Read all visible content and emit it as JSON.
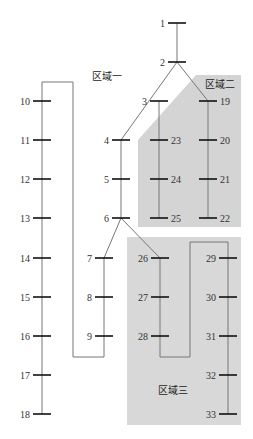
{
  "diagram": {
    "type": "IEEE 33-bus distribution network partition",
    "colors": {
      "background": "#ffffff",
      "zone_fill": "#d4d4d4",
      "line": "#777777",
      "bus": "#111111",
      "label": "#333333"
    },
    "zones": [
      {
        "id": "zone1",
        "label": "区域一",
        "x": 92,
        "y": 80
      },
      {
        "id": "zone2",
        "label": "区域二",
        "x": 205,
        "y": 88
      },
      {
        "id": "zone3",
        "label": "区域三",
        "x": 158,
        "y": 394
      }
    ],
    "buses": [
      {
        "id": 1,
        "x": 177,
        "y": 23,
        "label_side": "left"
      },
      {
        "id": 2,
        "x": 177,
        "y": 62,
        "label_side": "left"
      },
      {
        "id": 3,
        "x": 159,
        "y": 101,
        "label_side": "left"
      },
      {
        "id": 4,
        "x": 121,
        "y": 140,
        "label_side": "left"
      },
      {
        "id": 5,
        "x": 121,
        "y": 179,
        "label_side": "left"
      },
      {
        "id": 6,
        "x": 121,
        "y": 218,
        "label_side": "left"
      },
      {
        "id": 7,
        "x": 104,
        "y": 258,
        "label_side": "left"
      },
      {
        "id": 8,
        "x": 104,
        "y": 297,
        "label_side": "left"
      },
      {
        "id": 9,
        "x": 104,
        "y": 336,
        "label_side": "left"
      },
      {
        "id": 10,
        "x": 42,
        "y": 101,
        "label_side": "left"
      },
      {
        "id": 11,
        "x": 42,
        "y": 140,
        "label_side": "left"
      },
      {
        "id": 12,
        "x": 42,
        "y": 179,
        "label_side": "left"
      },
      {
        "id": 13,
        "x": 42,
        "y": 218,
        "label_side": "left"
      },
      {
        "id": 14,
        "x": 42,
        "y": 258,
        "label_side": "left"
      },
      {
        "id": 15,
        "x": 42,
        "y": 297,
        "label_side": "left"
      },
      {
        "id": 16,
        "x": 42,
        "y": 336,
        "label_side": "left"
      },
      {
        "id": 17,
        "x": 42,
        "y": 375,
        "label_side": "left"
      },
      {
        "id": 18,
        "x": 42,
        "y": 414,
        "label_side": "left"
      },
      {
        "id": 19,
        "x": 208,
        "y": 101,
        "label_side": "right"
      },
      {
        "id": 20,
        "x": 208,
        "y": 140,
        "label_side": "right"
      },
      {
        "id": 21,
        "x": 208,
        "y": 179,
        "label_side": "right"
      },
      {
        "id": 22,
        "x": 208,
        "y": 218,
        "label_side": "right"
      },
      {
        "id": 23,
        "x": 159,
        "y": 140,
        "label_side": "right"
      },
      {
        "id": 24,
        "x": 159,
        "y": 179,
        "label_side": "right"
      },
      {
        "id": 25,
        "x": 159,
        "y": 218,
        "label_side": "right"
      },
      {
        "id": 26,
        "x": 160,
        "y": 258,
        "label_side": "left"
      },
      {
        "id": 27,
        "x": 160,
        "y": 297,
        "label_side": "left"
      },
      {
        "id": 28,
        "x": 160,
        "y": 336,
        "label_side": "left"
      },
      {
        "id": 29,
        "x": 228,
        "y": 258,
        "label_side": "left"
      },
      {
        "id": 30,
        "x": 228,
        "y": 297,
        "label_side": "left"
      },
      {
        "id": 31,
        "x": 228,
        "y": 336,
        "label_side": "left"
      },
      {
        "id": 32,
        "x": 228,
        "y": 375,
        "label_side": "left"
      },
      {
        "id": 33,
        "x": 228,
        "y": 414,
        "label_side": "left"
      }
    ]
  }
}
